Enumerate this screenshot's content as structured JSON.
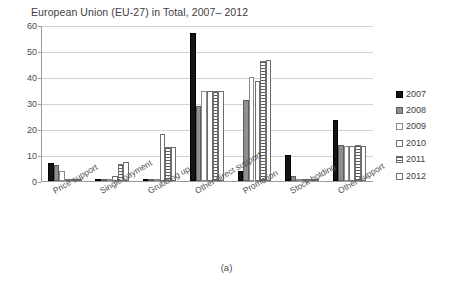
{
  "chart_data": {
    "type": "bar",
    "title": "European Union (EU-27) in Total, 2007– 2012",
    "xlabel": "",
    "ylabel": "",
    "ylim": [
      0,
      60
    ],
    "yticks": [
      0,
      10,
      20,
      30,
      40,
      50,
      60
    ],
    "grid": true,
    "legend_position": "right",
    "categories": [
      "Price support",
      "Single payment",
      "Grubbing up",
      "Other direct support",
      "Promotion",
      "Stock holding",
      "Other support"
    ],
    "series": [
      {
        "name": "2007",
        "color": "#141414",
        "pattern": "solid",
        "values": [
          7.0,
          0.0,
          0.0,
          57.0,
          4.0,
          10.0,
          23.5
        ]
      },
      {
        "name": "2008",
        "color": "#8f8f8f",
        "pattern": "gray",
        "values": [
          6.0,
          0.0,
          0.0,
          29.0,
          31.0,
          2.0,
          14.0
        ]
      },
      {
        "name": "2009",
        "color": "#ffffff",
        "pattern": "white",
        "values": [
          4.0,
          0.0,
          0.0,
          34.5,
          40.0,
          0.5,
          13.5
        ]
      },
      {
        "name": "2010",
        "color": "#ffffff",
        "pattern": "outline",
        "values": [
          0.6,
          2.0,
          18.0,
          34.5,
          38.5,
          0.4,
          13.5
        ]
      },
      {
        "name": "2011",
        "color": "#ffffff",
        "pattern": "horizontal-stripes",
        "values": [
          0.4,
          6.5,
          13.0,
          34.5,
          46.0,
          0.3,
          14.0
        ]
      },
      {
        "name": "2012",
        "color": "#ffffff",
        "pattern": "white",
        "values": [
          0.3,
          7.5,
          13.0,
          34.5,
          46.5,
          0.3,
          13.5
        ]
      }
    ]
  },
  "caption": {
    "text": "(a)"
  }
}
